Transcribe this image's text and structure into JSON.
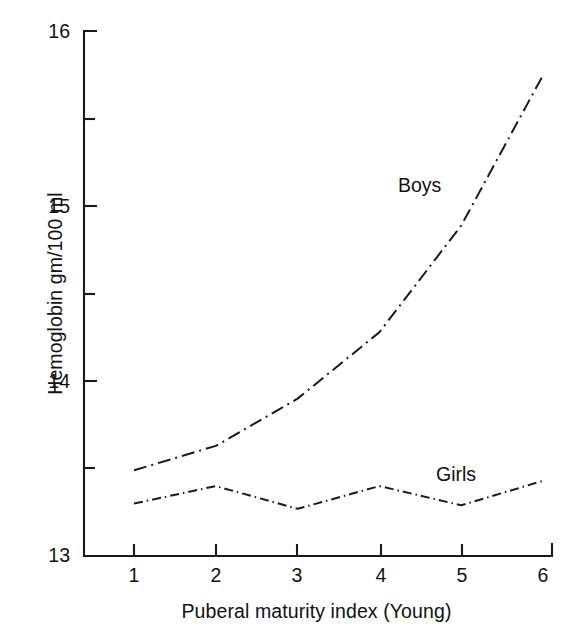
{
  "chart_data": {
    "type": "line",
    "title": "",
    "xlabel": "Puberal maturity index (Young)",
    "ylabel": "Hemoglobin gm/100 ml",
    "x": [
      1,
      2,
      3,
      4,
      5,
      6
    ],
    "xtick_labels": [
      "1",
      "2",
      "3",
      "4",
      "5",
      "6"
    ],
    "ytick_labels": [
      "13",
      "14",
      "15",
      "16"
    ],
    "ytick_values": [
      13,
      14,
      15,
      16
    ],
    "yminor_values": [
      13.5,
      14.5,
      15.5
    ],
    "xlim": [
      0.6,
      6.0
    ],
    "ylim": [
      13,
      16
    ],
    "grid": false,
    "legend_position": "inline-annotation",
    "series": [
      {
        "name": "Boys",
        "label": "Boys",
        "linestyle": "dash-dot",
        "color": "#1a1a1a",
        "values": [
          13.49,
          13.63,
          13.9,
          14.28,
          14.89,
          15.75
        ]
      },
      {
        "name": "Girls",
        "label": "Girls",
        "linestyle": "dash-dot-fine",
        "color": "#1a1a1a",
        "values": [
          13.3,
          13.4,
          13.27,
          13.4,
          13.29,
          13.43
        ]
      }
    ]
  },
  "axes": {
    "y_title": "Hemoglobin gm/100 ml",
    "x_title": "Puberal maturity index (Young)"
  },
  "ticks": {
    "y": [
      {
        "label": "16",
        "value": 16
      },
      {
        "label": "15",
        "value": 15
      },
      {
        "label": "14",
        "value": 14
      },
      {
        "label": "13",
        "value": 13
      }
    ],
    "x": [
      {
        "label": "1",
        "value": 1
      },
      {
        "label": "2",
        "value": 2
      },
      {
        "label": "3",
        "value": 3
      },
      {
        "label": "4",
        "value": 4
      },
      {
        "label": "5",
        "value": 5
      },
      {
        "label": "6",
        "value": 6
      }
    ]
  },
  "annotations": {
    "boys": "Boys",
    "girls": "Girls"
  }
}
